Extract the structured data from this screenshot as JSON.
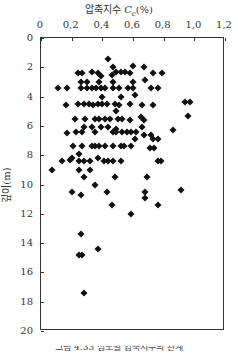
{
  "chart_data": {
    "type": "scatter",
    "title": "",
    "xlabel": "압축지수 Cc(%)",
    "xlabel_parts": {
      "prefix": "압축지수 ",
      "symbol": "C",
      "subscript": "c",
      "suffix": "(%)"
    },
    "ylabel": "깊이(m)",
    "xlim": [
      0,
      1.2
    ],
    "ylim": [
      20,
      0
    ],
    "y_inverted": true,
    "x_axis_position": "top",
    "xticks": [
      "0",
      "0.2",
      "0.4",
      "0.6",
      "0.8",
      "1.0",
      "1.2"
    ],
    "yticks": [
      "0",
      "2",
      "4",
      "6",
      "8",
      "10",
      "12",
      "14",
      "16",
      "18",
      "20"
    ],
    "grid": false,
    "legend": null,
    "marker": "diamond",
    "marker_color": "#111111",
    "points": [
      [
        0.44,
        1.4
      ],
      [
        0.47,
        2.0
      ],
      [
        0.6,
        1.9
      ],
      [
        0.24,
        2.4
      ],
      [
        0.27,
        2.4
      ],
      [
        0.33,
        2.3
      ],
      [
        0.37,
        2.4
      ],
      [
        0.39,
        2.6
      ],
      [
        0.46,
        2.5
      ],
      [
        0.49,
        2.3
      ],
      [
        0.52,
        2.3
      ],
      [
        0.55,
        2.3
      ],
      [
        0.58,
        2.4
      ],
      [
        0.67,
        2.0
      ],
      [
        0.73,
        2.4
      ],
      [
        0.79,
        2.4
      ],
      [
        0.26,
        3.0
      ],
      [
        0.3,
        3.0
      ],
      [
        0.38,
        3.0
      ],
      [
        0.47,
        3.0
      ],
      [
        0.6,
        3.0
      ],
      [
        0.68,
        2.9
      ],
      [
        0.11,
        3.4
      ],
      [
        0.17,
        3.4
      ],
      [
        0.26,
        3.4
      ],
      [
        0.3,
        3.4
      ],
      [
        0.33,
        3.4
      ],
      [
        0.36,
        3.4
      ],
      [
        0.39,
        3.4
      ],
      [
        0.42,
        3.4
      ],
      [
        0.47,
        3.4
      ],
      [
        0.51,
        3.4
      ],
      [
        0.57,
        3.4
      ],
      [
        0.6,
        3.4
      ],
      [
        0.72,
        3.4
      ],
      [
        0.76,
        3.4
      ],
      [
        0.4,
        4.0
      ],
      [
        0.52,
        4.0
      ],
      [
        0.61,
        3.9
      ],
      [
        0.16,
        4.6
      ],
      [
        0.24,
        4.5
      ],
      [
        0.28,
        4.5
      ],
      [
        0.31,
        4.5
      ],
      [
        0.34,
        4.6
      ],
      [
        0.37,
        4.5
      ],
      [
        0.4,
        4.5
      ],
      [
        0.43,
        4.5
      ],
      [
        0.48,
        4.5
      ],
      [
        0.51,
        4.6
      ],
      [
        0.58,
        4.5
      ],
      [
        0.66,
        4.6
      ],
      [
        0.73,
        4.6
      ],
      [
        0.94,
        4.4
      ],
      [
        0.97,
        4.4
      ],
      [
        0.49,
        5.0
      ],
      [
        0.96,
        5.3
      ],
      [
        0.22,
        5.5
      ],
      [
        0.29,
        5.5
      ],
      [
        0.35,
        5.5
      ],
      [
        0.38,
        5.5
      ],
      [
        0.42,
        5.5
      ],
      [
        0.45,
        5.5
      ],
      [
        0.5,
        5.5
      ],
      [
        0.53,
        5.5
      ],
      [
        0.58,
        5.6
      ],
      [
        0.65,
        5.4
      ],
      [
        0.67,
        5.6
      ],
      [
        0.28,
        6.1
      ],
      [
        0.33,
        6.1
      ],
      [
        0.39,
        6.1
      ],
      [
        0.44,
        6.1
      ],
      [
        0.49,
        6.2
      ],
      [
        0.66,
        6.1
      ],
      [
        0.86,
        6.3
      ],
      [
        0.17,
        6.5
      ],
      [
        0.23,
        6.4
      ],
      [
        0.27,
        6.4
      ],
      [
        0.35,
        6.4
      ],
      [
        0.47,
        6.4
      ],
      [
        0.49,
        6.4
      ],
      [
        0.53,
        6.4
      ],
      [
        0.56,
        6.4
      ],
      [
        0.59,
        6.4
      ],
      [
        0.62,
        6.4
      ],
      [
        0.67,
        6.6
      ],
      [
        0.72,
        6.6
      ],
      [
        0.61,
        6.9
      ],
      [
        0.73,
        6.9
      ],
      [
        0.76,
        6.9
      ],
      [
        0.21,
        7.4
      ],
      [
        0.27,
        7.4
      ],
      [
        0.33,
        7.4
      ],
      [
        0.35,
        7.4
      ],
      [
        0.38,
        7.4
      ],
      [
        0.42,
        7.4
      ],
      [
        0.47,
        7.4
      ],
      [
        0.52,
        7.4
      ],
      [
        0.54,
        7.4
      ],
      [
        0.59,
        7.4
      ],
      [
        0.71,
        7.5
      ],
      [
        0.74,
        7.5
      ],
      [
        0.25,
        7.9
      ],
      [
        0.14,
        8.4
      ],
      [
        0.19,
        8.3
      ],
      [
        0.2,
        8.2
      ],
      [
        0.25,
        8.4
      ],
      [
        0.28,
        8.4
      ],
      [
        0.32,
        8.4
      ],
      [
        0.37,
        8.2
      ],
      [
        0.41,
        8.4
      ],
      [
        0.44,
        8.4
      ],
      [
        0.47,
        8.4
      ],
      [
        0.52,
        8.4
      ],
      [
        0.76,
        8.4
      ],
      [
        0.78,
        8.4
      ],
      [
        0.07,
        9.0
      ],
      [
        0.25,
        9.0
      ],
      [
        0.32,
        9.0
      ],
      [
        0.28,
        9.5
      ],
      [
        0.48,
        9.5
      ],
      [
        0.69,
        9.5
      ],
      [
        0.35,
        10.0
      ],
      [
        0.2,
        10.5
      ],
      [
        0.26,
        10.7
      ],
      [
        0.43,
        10.5
      ],
      [
        0.68,
        10.5
      ],
      [
        0.68,
        10.9
      ],
      [
        0.91,
        10.4
      ],
      [
        0.46,
        11.4
      ],
      [
        0.76,
        11.4
      ],
      [
        0.59,
        12.0
      ],
      [
        0.26,
        13.4
      ],
      [
        0.37,
        14.4
      ],
      [
        0.25,
        14.8
      ],
      [
        0.27,
        14.8
      ],
      [
        0.28,
        17.4
      ]
    ]
  },
  "caption": "그림 4.33 심도별 압축지수의 관계"
}
